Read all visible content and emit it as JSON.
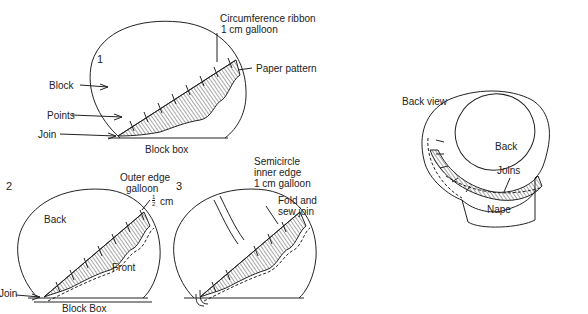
{
  "figure": {
    "panel1": {
      "number": "1",
      "labels": {
        "circumference_line1": "Circumference ribbon",
        "circumference_line2": "1 cm galloon",
        "paper_pattern": "Paper pattern",
        "block": "Block",
        "points": "Points",
        "join": "Join",
        "block_box": "Block box"
      }
    },
    "panel2": {
      "number": "2",
      "labels": {
        "outer_edge_line1": "Outer edge",
        "outer_edge_line2": "galloon",
        "half_cm_num": "1",
        "half_cm_den": "2",
        "half_cm_unit": "cm",
        "back": "Back",
        "front": "Front",
        "join": "Join",
        "block_box": "Block Box"
      }
    },
    "panel3": {
      "number": "3",
      "labels": {
        "semicircle_line1": "Semicircle",
        "semicircle_line2": "inner edge",
        "semicircle_line3": "1 cm galloon",
        "fold_line1": "Fold and",
        "fold_line2": "sew join"
      }
    },
    "back_view": {
      "title": "Back view",
      "labels": {
        "back": "Back",
        "joins": "Joins",
        "nape": "Nape"
      }
    },
    "colors": {
      "line": "#222222",
      "background": "#ffffff"
    }
  }
}
